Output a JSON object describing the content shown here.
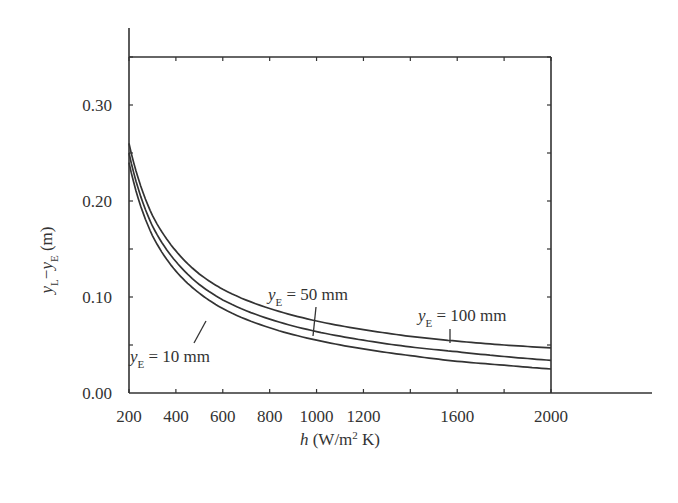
{
  "chart_data": {
    "type": "line",
    "title": "",
    "xlabel": "h (W/m² K)",
    "xlabel_parts": {
      "var": "h",
      "unit_pre": " (W/m",
      "sup": "2",
      "unit_post": " K)"
    },
    "ylabel": "yL−yE (m)",
    "ylabel_parts": {
      "y1": "y",
      "s1": "L",
      "dash": "−",
      "y2": "y",
      "s2": "E",
      "unit": " (m)"
    },
    "xlim": [
      200,
      2000
    ],
    "ylim": [
      0.0,
      0.35
    ],
    "xticks": [
      200,
      400,
      600,
      800,
      1000,
      1200,
      1600,
      2000
    ],
    "xtick_labels": [
      "200",
      "400",
      "600",
      "800",
      "1000",
      "1200",
      "1600",
      "2000"
    ],
    "yticks": [
      0.0,
      0.1,
      0.2,
      0.3
    ],
    "ytick_labels": [
      "0.00",
      "0.10",
      "0.20",
      "0.30"
    ],
    "grid": false,
    "legend": null,
    "x": [
      200,
      300,
      400,
      500,
      600,
      800,
      1000,
      1200,
      1400,
      1600,
      1800,
      2000
    ],
    "series": [
      {
        "name": "yE = 100 mm",
        "values": [
          0.26,
          0.185,
          0.148,
          0.124,
          0.108,
          0.088,
          0.075,
          0.066,
          0.059,
          0.054,
          0.05,
          0.047
        ]
      },
      {
        "name": "yE = 50 mm",
        "values": [
          0.25,
          0.174,
          0.137,
          0.113,
          0.097,
          0.077,
          0.064,
          0.055,
          0.048,
          0.043,
          0.038,
          0.034
        ]
      },
      {
        "name": "yE = 10 mm",
        "values": [
          0.24,
          0.164,
          0.127,
          0.104,
          0.088,
          0.068,
          0.055,
          0.046,
          0.039,
          0.033,
          0.029,
          0.025
        ]
      }
    ],
    "annotations": [
      {
        "text": "yE = 50 mm",
        "var": "y",
        "sub": "E",
        "rest": " = 50 mm",
        "points_to": "yE = 50 mm",
        "x": 1000
      },
      {
        "text": "yE = 100 mm",
        "var": "y",
        "sub": "E",
        "rest": " = 100 mm",
        "points_to": "yE = 100 mm",
        "x": 1600
      },
      {
        "text": "yE = 10 mm",
        "var": "y",
        "sub": "E",
        "rest": " = 10 mm",
        "points_to": "yE = 10 mm",
        "x": 560
      }
    ]
  }
}
